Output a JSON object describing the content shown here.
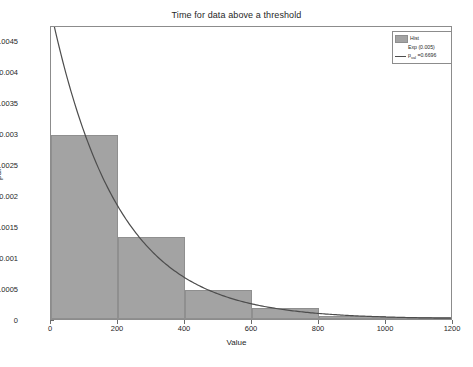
{
  "chart_data": {
    "type": "bar",
    "title": "Time for data above a threshold",
    "xlabel": "Value",
    "ylabel": "pdf",
    "xlim": [
      0,
      1200
    ],
    "ylim": [
      0,
      0.00475
    ],
    "grid": false,
    "legend_position": "top-right",
    "xticks": [
      "0",
      "200",
      "400",
      "600",
      "800",
      "1000",
      "1200"
    ],
    "xtick_values": [
      0,
      200,
      400,
      600,
      800,
      1000,
      1200
    ],
    "yticks": [
      "0",
      "0.0005",
      "0.001",
      "0.0015",
      "0.002",
      "0.0025",
      "0.003",
      "0.0035",
      "0.004",
      "0.0045"
    ],
    "ytick_values": [
      0,
      0.0005,
      0.001,
      0.0015,
      0.002,
      0.0025,
      0.003,
      0.0035,
      0.004,
      0.0045
    ],
    "bin_edges": [
      0,
      200,
      400,
      600,
      800,
      1000,
      1200
    ],
    "categories": [
      "0-200",
      "200-400",
      "400-600",
      "600-800",
      "800-1000",
      "1000-1200"
    ],
    "values": [
      0.00298,
      0.00133,
      0.00047,
      0.00017,
      5e-05,
      4e-05
    ],
    "series": [
      {
        "name": "Hist",
        "type": "bar",
        "color": "#a3a3a3",
        "values": [
          0.00298,
          0.00133,
          0.00047,
          0.00017,
          5e-05,
          4e-05
        ]
      },
      {
        "name": "Exp (0.005)",
        "type": "line",
        "color": "#4d4d4d",
        "rate": 0.005,
        "amplitude": 0.005,
        "description": "Exponential fit pdf = 0.005*exp(-0.005*x)"
      }
    ],
    "annotations": [
      "p_val =0.6696"
    ]
  },
  "legend": {
    "items": [
      {
        "label": "Hist",
        "marker": "patch"
      },
      {
        "label": "Exp (0.005)",
        "marker": "none"
      },
      {
        "label_prefix": "p",
        "label_sub": "val",
        "label_suffix": " =0.6696",
        "marker": "line"
      }
    ]
  },
  "colors": {
    "bar_fill": "#a3a3a3",
    "bar_edge": "#8f8f8f",
    "curve": "#4d4d4d",
    "axis": "#8c8c8c",
    "background": "#ffffff"
  }
}
